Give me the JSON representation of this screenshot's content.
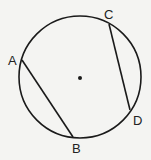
{
  "diagram": {
    "type": "circle-with-chords",
    "circle": {
      "cx": 80,
      "cy": 77,
      "r": 61,
      "stroke": "#1a1a1a"
    },
    "center_dot": {
      "cx": 80,
      "cy": 78,
      "r": 2
    },
    "points": [
      {
        "label": "A",
        "x": 22,
        "y": 60,
        "lx": 8,
        "ly": 65
      },
      {
        "label": "B",
        "x": 73,
        "y": 137,
        "lx": 72,
        "ly": 153
      },
      {
        "label": "C",
        "x": 109,
        "y": 24,
        "lx": 104,
        "ly": 19
      },
      {
        "label": "D",
        "x": 130,
        "y": 110,
        "lx": 133,
        "ly": 125
      }
    ],
    "chords": [
      {
        "from": "A",
        "to": "B"
      },
      {
        "from": "C",
        "to": "D"
      }
    ]
  }
}
